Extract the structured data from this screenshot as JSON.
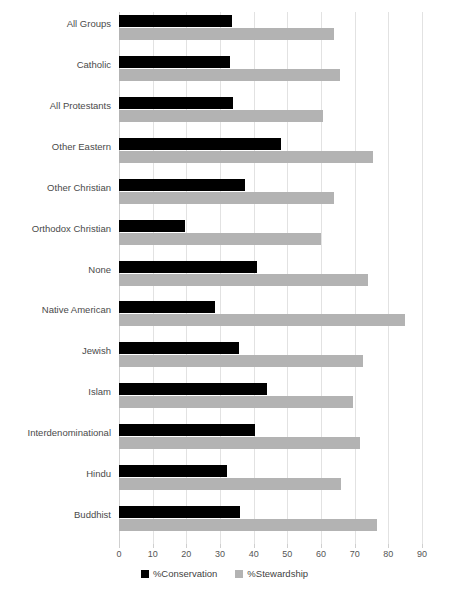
{
  "chart_data": {
    "type": "bar",
    "orientation": "horizontal",
    "title": "",
    "xlabel": "",
    "ylabel": "",
    "xlim": [
      0,
      90
    ],
    "xticks": [
      0,
      10,
      20,
      30,
      40,
      50,
      60,
      70,
      80,
      90
    ],
    "xtick_labels": [
      "0",
      "10",
      "20",
      "30",
      "40",
      "50",
      "60",
      "70",
      "80",
      "90"
    ],
    "grid": true,
    "legend_position": "bottom",
    "categories": [
      "All Groups",
      "Catholic",
      "All Protestants",
      "Other Eastern",
      "Other Christian",
      "Orthodox Christian",
      "None",
      "Native American",
      "Jewish",
      "Islam",
      "Interdenominational",
      "Hindu",
      "Buddhist"
    ],
    "series": [
      {
        "name": "%Conservation",
        "color": "#000000",
        "values": [
          33.5,
          33.0,
          34.0,
          48.0,
          37.5,
          19.5,
          41.0,
          28.5,
          35.5,
          44.0,
          40.5,
          32.0,
          36.0
        ]
      },
      {
        "name": "%Stewardship",
        "color": "#b3b3b3",
        "values": [
          64.0,
          65.5,
          60.5,
          75.5,
          64.0,
          60.0,
          74.0,
          85.0,
          72.5,
          69.5,
          71.5,
          66.0,
          76.5
        ]
      }
    ]
  },
  "legend": {
    "items": [
      {
        "label": "%Conservation",
        "color": "#000000"
      },
      {
        "label": "%Stewardship",
        "color": "#b3b3b3"
      }
    ]
  },
  "colors": {
    "conservation": "#000000",
    "stewardship": "#b3b3b3",
    "gridline": "#e2e2e2",
    "background": "#ffffff",
    "text": "#4a4a4a"
  }
}
